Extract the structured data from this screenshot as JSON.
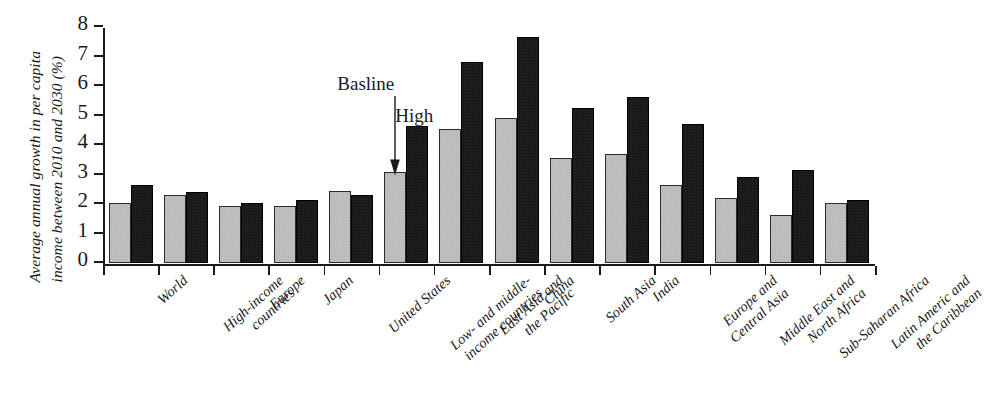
{
  "chart_data": {
    "type": "bar",
    "title": "",
    "xlabel": "",
    "ylabel": "Average annual growth in per capita income between 2010 and 2030 (%)",
    "ylabel_lines": [
      "Average annual growth in per capita",
      "income between 2010 and 2030 (%)"
    ],
    "ylim": [
      0,
      8
    ],
    "ytick_labels": [
      "0",
      "1",
      "2",
      "3",
      "4",
      "5",
      "6",
      "7",
      "8"
    ],
    "ytick_values": [
      0,
      1,
      2,
      3,
      4,
      5,
      6,
      7,
      8
    ],
    "grid": false,
    "legend_position": "annotation-arrows",
    "categories": [
      "World",
      "High-income countries",
      "Europe",
      "Japan",
      "United States",
      "Low- and middle-income countries",
      "East Asia and the Pacific",
      "China",
      "South Asia",
      "India",
      "Europe and Central Asia",
      "Middle East and North Africa",
      "Sub-Saharan Africa",
      "Latin Americ and the Caribbean"
    ],
    "category_lines": [
      [
        "World"
      ],
      [
        "High-income",
        "countries"
      ],
      [
        "Europe"
      ],
      [
        "Japan"
      ],
      [
        "United States"
      ],
      [
        "Low- and middle-",
        "income countries"
      ],
      [
        "East Asia and",
        "the Pacific"
      ],
      [
        "China"
      ],
      [
        "South Asia"
      ],
      [
        "India"
      ],
      [
        "Europe and",
        "Central Asia"
      ],
      [
        "Middle East and",
        "North Africa"
      ],
      [
        "Sub-Saharan Africa"
      ],
      [
        "Latin Americ and",
        "the Caribbean"
      ]
    ],
    "series": [
      {
        "name": "Basline",
        "color": "#b4b4b4",
        "values": [
          2.05,
          2.32,
          1.92,
          1.92,
          2.43,
          3.07,
          4.55,
          4.92,
          3.55,
          3.7,
          2.63,
          2.22,
          1.62,
          2.03
        ]
      },
      {
        "name": "High",
        "color": "#181818",
        "values": [
          2.65,
          2.42,
          2.03,
          2.12,
          2.3,
          4.65,
          6.83,
          7.67,
          5.25,
          5.62,
          4.72,
          2.92,
          3.15,
          2.12
        ]
      }
    ],
    "annotations": [
      {
        "text": "Basline",
        "points_to_series": "Basline",
        "points_to_category": "Low- and middle-income countries"
      },
      {
        "text": "High",
        "points_to_series": "High",
        "points_to_category": "Low- and middle-income countries"
      }
    ]
  }
}
